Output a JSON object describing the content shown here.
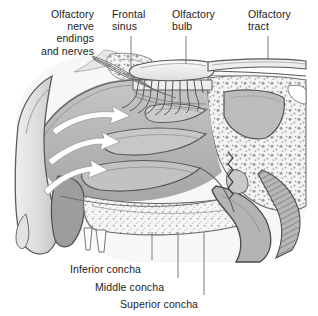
{
  "figure": {
    "kind": "anatomical-illustration",
    "view": "sagittal section of nasal cavity",
    "title_visible": false,
    "background_color": "#ffffff",
    "line_color": "#4a4a4a",
    "palette": {
      "lightest": "#f2f2f2",
      "light": "#dcdcdc",
      "mid_light": "#c9c9c9",
      "mid": "#b6b6b6",
      "mid_dark": "#a0a0a0",
      "dark": "#8a8a8a",
      "darkest": "#6e6e6e",
      "outline": "#3f3f3f",
      "arrow_fill": "#ffffff",
      "arrow_stroke": "#9a9a9a",
      "text": "#1b1b1b",
      "leader": "#6d6d6d"
    }
  },
  "labels": {
    "olfactory_nerve_endings": {
      "text": "Olfactory\nnerve\nendings\nand nerves",
      "align": "right",
      "x": 8,
      "y": 8,
      "width": 86
    },
    "frontal_sinus": {
      "text": "Frontal\nsinus",
      "align": "left",
      "x": 112,
      "y": 8,
      "width": 52
    },
    "olfactory_bulb": {
      "text": "Olfactory\nbulb",
      "align": "left",
      "x": 172,
      "y": 8,
      "width": 56
    },
    "olfactory_tract": {
      "text": "Olfactory\ntract",
      "align": "left",
      "x": 248,
      "y": 8,
      "width": 58
    },
    "inferior_concha": {
      "text": "Inferior concha",
      "align": "left",
      "x": 70,
      "y": 263,
      "width": 86
    },
    "middle_concha": {
      "text": "Middle concha",
      "align": "left",
      "x": 95,
      "y": 281,
      "width": 88
    },
    "superior_concha": {
      "text": "Superior concha",
      "align": "left",
      "x": 120,
      "y": 298,
      "width": 98
    }
  },
  "annotations": {
    "airflow_arrows": 3,
    "arrow_description": "white curved arrows indicating inspired airflow through nasal meatuses",
    "leader_lines": 7
  }
}
